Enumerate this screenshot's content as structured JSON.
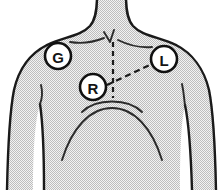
{
  "diagram": {
    "canvas": {
      "width": 224,
      "height": 190
    },
    "style": {
      "skin_fill": "#e8e8e8",
      "halftone_dot_color": "#b9b9b9",
      "outline_color": "#1a1a1a",
      "detail_line_color": "#2b2b2b",
      "dashed_line_color": "#1a1a1a",
      "marker_fill": "#ffffff",
      "marker_stroke": "#111111",
      "label_color": "#141414",
      "background": "#ffffff"
    },
    "electrodes": [
      {
        "id": "electrode-g",
        "label": "G",
        "name": "ground-electrode",
        "cx": 58,
        "cy": 56,
        "r": 13
      },
      {
        "id": "electrode-l",
        "label": "L",
        "name": "left-electrode",
        "cx": 164,
        "cy": 59,
        "r": 13
      },
      {
        "id": "electrode-r",
        "label": "R",
        "name": "right-electrode",
        "cx": 93,
        "cy": 87,
        "r": 13
      }
    ],
    "guides": [
      {
        "id": "guide-r-to-l",
        "name": "dashed-connector-r-to-l",
        "kind": "dashed-line",
        "from": "R",
        "to": "L"
      },
      {
        "id": "guide-sternum",
        "name": "dashed-sternum-midline",
        "kind": "dashed-line",
        "from": "suprasternal-notch",
        "to": "xiphoid"
      }
    ],
    "anatomy_features": [
      {
        "name": "neck",
        "visible": true
      },
      {
        "name": "clavicle-left",
        "visible": true
      },
      {
        "name": "clavicle-right",
        "visible": true
      },
      {
        "name": "suprasternal-notch",
        "visible": true
      },
      {
        "name": "shoulder-left",
        "visible": true
      },
      {
        "name": "shoulder-right",
        "visible": true
      },
      {
        "name": "arm-left",
        "visible": true
      },
      {
        "name": "arm-right",
        "visible": true
      },
      {
        "name": "armpit-crease-left",
        "visible": true
      },
      {
        "name": "armpit-crease-right",
        "visible": true
      },
      {
        "name": "pectoral-curve",
        "visible": true
      },
      {
        "name": "ribcage-curve",
        "visible": true
      },
      {
        "name": "torso",
        "visible": true
      }
    ]
  }
}
